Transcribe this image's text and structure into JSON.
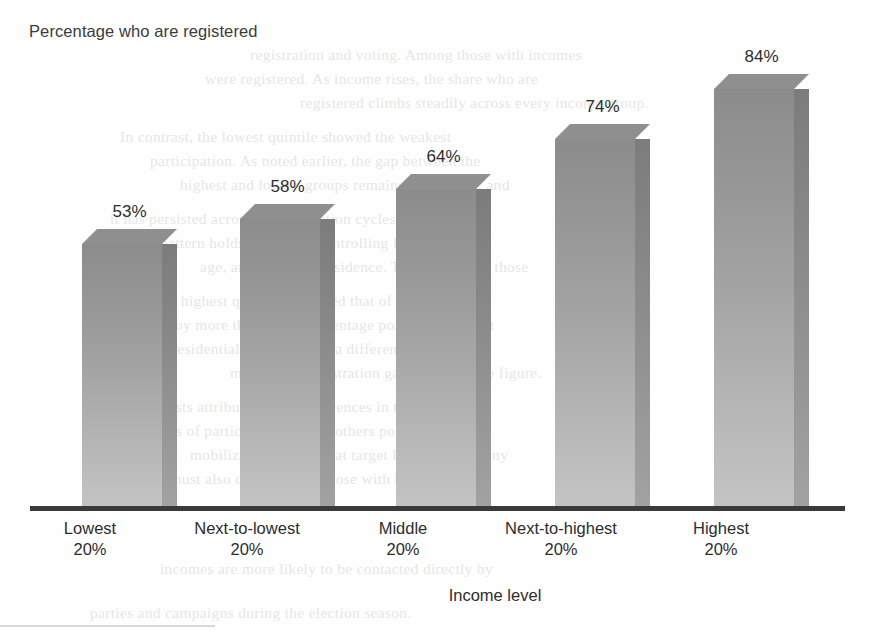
{
  "chart_data": {
    "type": "bar",
    "title": "Percentage who are registered",
    "xlabel": "Income level",
    "ylabel": "",
    "categories": [
      "Lowest 20%",
      "Next-to-lowest 20%",
      "Middle 20%",
      "Next-to-highest 20%",
      "Highest 20%"
    ],
    "category_lines": [
      {
        "line1": "Lowest",
        "line2": "20%"
      },
      {
        "line1": "Next-to-lowest",
        "line2": "20%"
      },
      {
        "line1": "Middle",
        "line2": "20%"
      },
      {
        "line1": "Next-to-highest",
        "line2": "20%"
      },
      {
        "line1": "Highest",
        "line2": "20%"
      }
    ],
    "values": [
      53,
      58,
      64,
      74,
      84
    ],
    "data_labels": [
      "53%",
      "58%",
      "64%",
      "74%",
      "84%"
    ],
    "ylim": [
      0,
      95
    ],
    "grid": false,
    "legend": null,
    "style": "3d-column",
    "colors": {
      "bar_front_top": "#8c8c8c",
      "bar_front_bottom": "#c4c4c4",
      "bar_side": "#7c7c7c",
      "bar_top": "#8f8f8f",
      "axis_line": "#3a3a3a",
      "text": "#2d2d2d",
      "title_text": "#3b3b3b",
      "background": "#fefefe"
    }
  },
  "ghost_text": {
    "lines": [
      "registration and voting. Among those with incomes",
      "were registered. As income rises, the share who are",
      "registered climbs steadily across every income group.",
      "In contrast, the lowest quintile showed the weakest",
      "participation. As noted earlier, the gap between the",
      "highest and lowest groups remains substantial, and",
      "it has persisted across recent election cycles. The",
      "pattern holds even after controlling for education,",
      "age, and region of residence. Turnout among those",
      "in the highest quintile exceeded that of the lowest",
      "by more than thirty percentage points in the most",
      "recent presidential election year, a difference that",
      "mirrors the registration gap shown in the figure.",
      "Some analysts attribute this to differences in the",
      "costs of participation, while others point toward",
      "mobilization efforts that target likely voters. Any",
      "account must also consider that those with higher",
      "incomes are more likely to be contacted directly by",
      "parties and campaigns during the election season."
    ]
  }
}
